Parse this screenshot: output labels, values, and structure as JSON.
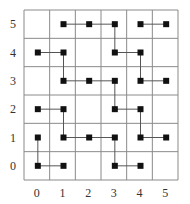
{
  "diagram": {
    "type": "grid-graph",
    "columns": 6,
    "rows": 6,
    "x_labels": [
      "0",
      "1",
      "2",
      "3",
      "4",
      "5"
    ],
    "y_labels": [
      "0",
      "1",
      "2",
      "3",
      "4",
      "5"
    ],
    "colors": {
      "grid": "#8a8a8a",
      "node": "#111111",
      "edge": "#555555",
      "label": "#333333"
    },
    "nodes": [
      [
        1,
        5
      ],
      [
        2,
        5
      ],
      [
        3,
        5
      ],
      [
        4,
        5
      ],
      [
        5,
        5
      ],
      [
        0,
        4
      ],
      [
        1,
        4
      ],
      [
        3,
        4
      ],
      [
        4,
        4
      ],
      [
        1,
        3
      ],
      [
        2,
        3
      ],
      [
        3,
        3
      ],
      [
        4,
        3
      ],
      [
        5,
        3
      ],
      [
        0,
        2
      ],
      [
        1,
        2
      ],
      [
        3,
        2
      ],
      [
        4,
        2
      ],
      [
        0,
        1
      ],
      [
        1,
        1
      ],
      [
        2,
        1
      ],
      [
        3,
        1
      ],
      [
        4,
        1
      ],
      [
        5,
        1
      ],
      [
        0,
        0
      ],
      [
        1,
        0
      ],
      [
        3,
        0
      ],
      [
        4,
        0
      ]
    ],
    "edges": [
      [
        [
          1,
          5
        ],
        [
          2,
          5
        ]
      ],
      [
        [
          2,
          5
        ],
        [
          3,
          5
        ]
      ],
      [
        [
          4,
          5
        ],
        [
          5,
          5
        ]
      ],
      [
        [
          3,
          5
        ],
        [
          3,
          4
        ]
      ],
      [
        [
          0,
          4
        ],
        [
          1,
          4
        ]
      ],
      [
        [
          3,
          4
        ],
        [
          4,
          4
        ]
      ],
      [
        [
          1,
          4
        ],
        [
          1,
          3
        ]
      ],
      [
        [
          4,
          4
        ],
        [
          4,
          3
        ]
      ],
      [
        [
          1,
          3
        ],
        [
          2,
          3
        ]
      ],
      [
        [
          2,
          3
        ],
        [
          3,
          3
        ]
      ],
      [
        [
          4,
          3
        ],
        [
          5,
          3
        ]
      ],
      [
        [
          3,
          3
        ],
        [
          3,
          2
        ]
      ],
      [
        [
          0,
          2
        ],
        [
          1,
          2
        ]
      ],
      [
        [
          3,
          2
        ],
        [
          4,
          2
        ]
      ],
      [
        [
          1,
          2
        ],
        [
          1,
          1
        ]
      ],
      [
        [
          4,
          2
        ],
        [
          4,
          1
        ]
      ],
      [
        [
          1,
          1
        ],
        [
          2,
          1
        ]
      ],
      [
        [
          2,
          1
        ],
        [
          3,
          1
        ]
      ],
      [
        [
          4,
          1
        ],
        [
          5,
          1
        ]
      ],
      [
        [
          0,
          1
        ],
        [
          0,
          0
        ]
      ],
      [
        [
          3,
          1
        ],
        [
          3,
          0
        ]
      ],
      [
        [
          0,
          0
        ],
        [
          1,
          0
        ]
      ],
      [
        [
          3,
          0
        ],
        [
          4,
          0
        ]
      ]
    ]
  }
}
